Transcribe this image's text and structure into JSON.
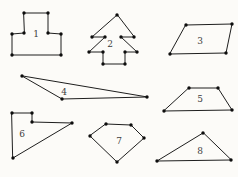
{
  "figure": {
    "background_color": "#fcfbf8",
    "stroke_color": "#1e1e1e",
    "dot_color": "#0d0d0d",
    "label_color": "#3d3d3d",
    "canvas": {
      "width": 238,
      "height": 177
    },
    "shapes": [
      {
        "label": "1",
        "name": "t-shape-octagon",
        "label_pos": [
          36,
          34
        ],
        "vertices": [
          [
            24,
            13
          ],
          [
            48,
            13
          ],
          [
            48,
            33
          ],
          [
            61,
            34
          ],
          [
            61,
            55
          ],
          [
            12,
            55
          ],
          [
            12,
            34
          ],
          [
            24,
            33
          ]
        ]
      },
      {
        "label": "2",
        "name": "tree-shape-polygon",
        "label_pos": [
          110,
          44
        ],
        "vertices": [
          [
            117,
            15
          ],
          [
            92,
            37
          ],
          [
            105,
            37
          ],
          [
            89,
            52
          ],
          [
            103,
            52
          ],
          [
            103,
            64
          ],
          [
            125,
            64
          ],
          [
            125,
            52
          ],
          [
            137,
            52
          ],
          [
            121,
            37
          ],
          [
            134,
            37
          ]
        ]
      },
      {
        "label": "3",
        "name": "parallelogram",
        "label_pos": [
          200,
          41
        ],
        "vertices": [
          [
            186,
            25
          ],
          [
            232,
            24
          ],
          [
            226,
            53
          ],
          [
            170,
            54
          ]
        ]
      },
      {
        "label": "4",
        "name": "thin-obtuse-triangle",
        "label_pos": [
          64,
          92
        ],
        "vertices": [
          [
            22,
            76
          ],
          [
            62,
            99
          ],
          [
            147,
            97
          ]
        ]
      },
      {
        "label": "5",
        "name": "trapezoid",
        "label_pos": [
          200,
          99
        ],
        "vertices": [
          [
            189,
            88
          ],
          [
            218,
            88
          ],
          [
            232,
            110
          ],
          [
            164,
            111
          ]
        ]
      },
      {
        "label": "6",
        "name": "concave-pentagon",
        "label_pos": [
          22,
          134
        ],
        "vertices": [
          [
            12,
            113
          ],
          [
            32,
            113
          ],
          [
            32,
            122
          ],
          [
            72,
            123
          ],
          [
            13,
            158
          ]
        ]
      },
      {
        "label": "7",
        "name": "pentagon",
        "label_pos": [
          119,
          141
        ],
        "vertices": [
          [
            106,
            124
          ],
          [
            131,
            125
          ],
          [
            144,
            138
          ],
          [
            117,
            162
          ],
          [
            90,
            136
          ]
        ]
      },
      {
        "label": "8",
        "name": "obtuse-triangle",
        "label_pos": [
          200,
          151
        ],
        "vertices": [
          [
            203,
            133
          ],
          [
            157,
            161
          ],
          [
            231,
            160
          ]
        ]
      }
    ]
  }
}
